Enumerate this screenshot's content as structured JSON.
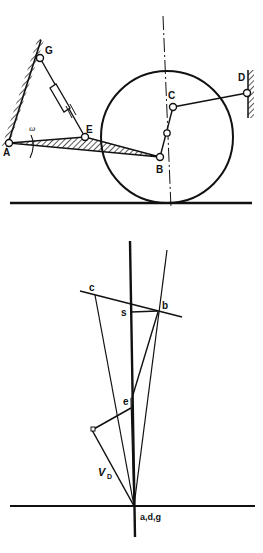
{
  "mechanism": {
    "labels": {
      "G": "G",
      "A": "A",
      "E": "E",
      "B": "B",
      "C": "C",
      "D": "D",
      "omega": "ω"
    }
  },
  "velocity_polygon": {
    "labels": {
      "c": "c",
      "b": "b",
      "s": "s",
      "e": "e",
      "vD": "V",
      "vD_sub": "D",
      "origin": "a,d,g"
    }
  },
  "colors": {
    "ink": "#111111",
    "background": "#ffffff"
  }
}
